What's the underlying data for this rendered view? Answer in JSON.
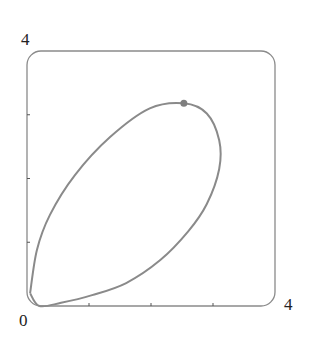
{
  "chart_data": {
    "type": "line",
    "title": "",
    "xlabel": "",
    "ylabel": "",
    "xlim": [
      0,
      4
    ],
    "ylim": [
      0,
      4
    ],
    "grid": false,
    "frame": "rounded-box",
    "tick_labels": {
      "x_min": "0",
      "x_max": "4",
      "y_max": "4"
    },
    "x_ticks": [
      1,
      2,
      3
    ],
    "y_ticks": [
      1,
      2,
      3
    ],
    "series": [
      {
        "name": "closed loop curve",
        "closed": true,
        "points": [
          [
            0.05,
            0.2
          ],
          [
            0.16,
            0.88
          ],
          [
            0.37,
            1.43
          ],
          [
            0.77,
            2.05
          ],
          [
            1.34,
            2.65
          ],
          [
            1.98,
            3.1
          ],
          [
            2.53,
            3.18
          ],
          [
            2.9,
            3.02
          ],
          [
            3.1,
            2.6
          ],
          [
            3.1,
            2.15
          ],
          [
            2.9,
            1.6
          ],
          [
            2.6,
            1.17
          ],
          [
            2.15,
            0.72
          ],
          [
            1.6,
            0.36
          ],
          [
            1.05,
            0.17
          ],
          [
            0.55,
            0.05
          ],
          [
            0.2,
            0.0
          ],
          [
            0.05,
            0.2
          ]
        ]
      }
    ],
    "markers": [
      {
        "x": 2.53,
        "y": 3.18,
        "label": ""
      }
    ],
    "colors": {
      "curve": "#8a8a8a",
      "frame": "#8a8a8a",
      "marker": "#7f7f7f"
    }
  },
  "labels": {
    "y_top": "4",
    "origin": "0",
    "x_right": "4"
  }
}
